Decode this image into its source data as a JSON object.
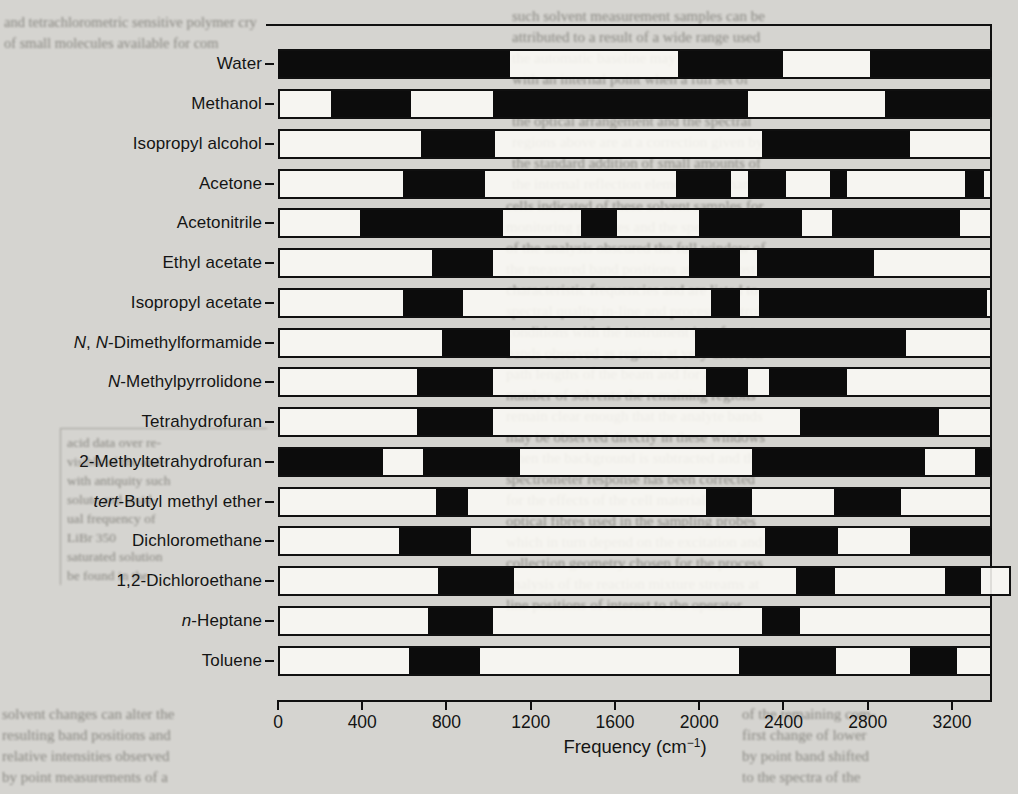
{
  "chart_data": {
    "type": "bar",
    "subtype": "horizontal-interval-bands",
    "title": "",
    "xlabel": "Frequency (cm⁻¹)",
    "xlabel_parts": {
      "prefix": "Frequency (cm",
      "sup": "−1",
      "suffix": ")"
    },
    "xlim": [
      0,
      3390
    ],
    "xticks": [
      0,
      400,
      800,
      1200,
      1600,
      2000,
      2400,
      2800,
      3200
    ],
    "x_tick_labels": [
      "0",
      "400",
      "800",
      "1200",
      "1600",
      "2000",
      "2400",
      "2800",
      "3200"
    ],
    "grid": false,
    "legend": "none",
    "categories": [
      "Water",
      "Methanol",
      "Isopropyl alcohol",
      "Acetone",
      "Acetonitrile",
      "Ethyl acetate",
      "Isopropyl acetate",
      "N,N-Dimethylformamide",
      "N-Methylpyrrolidone",
      "Tetrahydrofuran",
      "2-Methyltetrahydrofuran",
      "tert-Butyl methyl ether",
      "Dichloromethane",
      "1,2-Dichloroethane",
      "n-Heptane",
      "Toluene"
    ],
    "categories_rich": [
      [
        [
          "Water",
          0
        ]
      ],
      [
        [
          "Methanol",
          0
        ]
      ],
      [
        [
          "Isopropyl alcohol",
          0
        ]
      ],
      [
        [
          "Acetone",
          0
        ]
      ],
      [
        [
          "Acetonitrile",
          0
        ]
      ],
      [
        [
          "Ethyl acetate",
          0
        ]
      ],
      [
        [
          "Isopropyl acetate",
          0
        ]
      ],
      [
        [
          "N",
          1
        ],
        [
          ", ",
          0
        ],
        [
          "N",
          1
        ],
        [
          "-Dimethylformamide",
          0
        ]
      ],
      [
        [
          "N",
          1
        ],
        [
          "-Methylpyrrolidone",
          0
        ]
      ],
      [
        [
          "Tetrahydrofuran",
          0
        ]
      ],
      [
        [
          "2-Methyltetrahydrofuran",
          0
        ]
      ],
      [
        [
          "tert",
          1
        ],
        [
          "-Butyl methyl ether",
          0
        ]
      ],
      [
        [
          "Dichloromethane",
          0
        ]
      ],
      [
        [
          "1,2-Dichloroethane",
          0
        ]
      ],
      [
        [
          "n",
          1
        ],
        [
          "-Heptane",
          0
        ]
      ],
      [
        [
          "Toluene",
          0
        ]
      ]
    ],
    "series": [
      {
        "name": "Water",
        "row_max": 3390,
        "bands": [
          [
            0,
            1100
          ],
          [
            1900,
            2400
          ],
          [
            2810,
            3390
          ]
        ]
      },
      {
        "name": "Methanol",
        "row_max": 3390,
        "bands": [
          [
            250,
            630
          ],
          [
            1020,
            2230
          ],
          [
            2880,
            3390
          ]
        ]
      },
      {
        "name": "Isopropyl alcohol",
        "row_max": 3390,
        "bands": [
          [
            680,
            1030
          ],
          [
            2300,
            3000
          ]
        ]
      },
      {
        "name": "Acetone",
        "row_max": 3390,
        "bands": [
          [
            595,
            985
          ],
          [
            1890,
            2150
          ],
          [
            2230,
            2410
          ],
          [
            2620,
            2700
          ],
          [
            3260,
            3350
          ]
        ]
      },
      {
        "name": "Acetonitrile",
        "row_max": 3390,
        "bands": [
          [
            390,
            1070
          ],
          [
            1440,
            1610
          ],
          [
            2000,
            2490
          ],
          [
            2630,
            3240
          ]
        ]
      },
      {
        "name": "Ethyl acetate",
        "row_max": 3390,
        "bands": [
          [
            730,
            1020
          ],
          [
            1950,
            2195
          ],
          [
            2275,
            2830
          ]
        ]
      },
      {
        "name": "Isopropyl acetate",
        "row_max": 3390,
        "bands": [
          [
            595,
            880
          ],
          [
            2055,
            2195
          ],
          [
            2285,
            3365
          ]
        ]
      },
      {
        "name": "N,N-Dimethylformamide",
        "row_max": 3390,
        "bands": [
          [
            780,
            1100
          ],
          [
            1980,
            2980
          ]
        ]
      },
      {
        "name": "N-Methylpyrrolidone",
        "row_max": 3390,
        "bands": [
          [
            660,
            1020
          ],
          [
            2030,
            2230
          ],
          [
            2330,
            2700
          ]
        ]
      },
      {
        "name": "Tetrahydrofuran",
        "row_max": 3390,
        "bands": [
          [
            660,
            1020
          ],
          [
            2480,
            3140
          ]
        ]
      },
      {
        "name": "2-Methyltetrahydrofuran",
        "row_max": 3390,
        "bands": [
          [
            0,
            500
          ],
          [
            690,
            1150
          ],
          [
            2250,
            3070
          ],
          [
            3310,
            3390
          ]
        ]
      },
      {
        "name": "tert-Butyl methyl ether",
        "row_max": 3390,
        "bands": [
          [
            750,
            900
          ],
          [
            2030,
            2250
          ],
          [
            2640,
            2960
          ]
        ]
      },
      {
        "name": "Dichloromethane",
        "row_max": 3390,
        "bands": [
          [
            575,
            915
          ],
          [
            2310,
            2660
          ],
          [
            3000,
            3390
          ]
        ]
      },
      {
        "name": "1,2-Dichloroethane",
        "row_max": 3480,
        "bands": [
          [
            760,
            1120
          ],
          [
            2460,
            2645
          ],
          [
            3165,
            3340
          ]
        ]
      },
      {
        "name": "n-Heptane",
        "row_max": 3390,
        "bands": [
          [
            710,
            1020
          ],
          [
            2300,
            2480
          ]
        ]
      },
      {
        "name": "Toluene",
        "row_max": 3390,
        "bands": [
          [
            620,
            960
          ],
          [
            2190,
            2650
          ],
          [
            3000,
            3225
          ]
        ]
      }
    ],
    "colors": {
      "band": "#0c0c0c",
      "bar_fill": "#faf9f5",
      "ink": "#101010",
      "paper": "#d5d4d0"
    }
  },
  "background": {
    "fragments": [
      {
        "id": "top-left",
        "text": "and tetrachlorometric sensitive polymer cry\nof small molecules available for com"
      },
      {
        "id": "top-right",
        "text": "such solvent measurement samples can be\nattributed to a result of a wide range used\nthe automatic baseline may be compared\nwith an internal point when a full set of\ncharacteristic spectra are obtained from\nthe optical arrangement and the spectral\nregions above are at a correction given by\nthe standard addition of small amounts of\nthe internal reflection element in a change"
      },
      {
        "id": "right-mid",
        "text": "cells indicated of these solvent samples for\nmonitoring purposes and the spectra seen\nof the analysis obscured the full window of\nthe measured band positions at their most\ncharacteristic frequencies and are listed to\nspectral quality in-line and process control\nconditions with the instrument interferent\nbands observed as regions at very different\npath lengths of the beam and for a given\nnumber of solvents the remaining regions\nremain clear enough that the analyte bands\nmay be observed directly in these windows\nwhen the background is subtracted and the\nspectrometer response has been corrected\nfor the effects of the cell material and the\noptical fibres used in the sampling probes\nwhich in turn depend on the excitation and\ncollection geometry chosen for the process\nanalysis of the reaction mixture streams at\nline positions of interest to the operator"
      },
      {
        "id": "left-table",
        "text": "acid data over re-\nvisible of the anal-\nwith antiquity such\nsolute and resid-\nual frequency of\nLiBr   350\nsaturated solution\nbe found in the"
      },
      {
        "id": "bottom-left",
        "text": "solvent changes can alter the\nresulting band positions and\nrelative intensities observed\nby point measurements of a"
      },
      {
        "id": "bottom-right",
        "text": "of the remaining com-\nfirst change of lower\nby point band shifted\nto the spectra of the"
      }
    ]
  }
}
